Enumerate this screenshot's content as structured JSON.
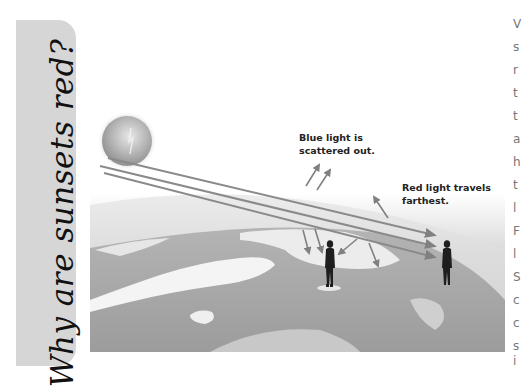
{
  "sidebar_tab": {
    "title": "Why are sunsets red?",
    "background": "#d6d6d6"
  },
  "figure": {
    "labels": {
      "blue_line1": "Blue light is",
      "blue_line2": "scattered out.",
      "red_line1": "Red light travels",
      "red_line2": "farthest."
    },
    "elements": [
      "sun",
      "earth-horizon",
      "three-light-rays",
      "scatter-arrows",
      "observer-left",
      "observer-right"
    ],
    "colors": {
      "arrow": "#808080",
      "earth": "#a8a8a8",
      "cloud": "#f2f2f2",
      "silhouette": "#1e1e1e"
    }
  },
  "body_text_fragments": [
    "V",
    "s",
    "r",
    "t",
    "t",
    "a",
    "h",
    "t",
    "l",
    "F",
    "l",
    "S",
    "c",
    "c",
    "s",
    "i"
  ]
}
